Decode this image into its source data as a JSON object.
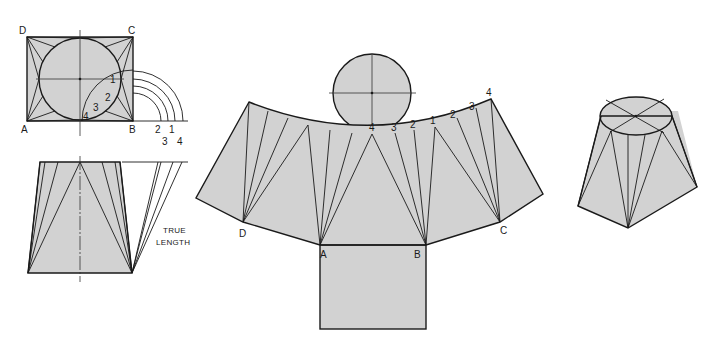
{
  "figure": {
    "colors": {
      "fill": "#d2d2d2",
      "line": "#1a1a1a",
      "background": "#ffffff"
    }
  },
  "top_view": {
    "corner_labels": {
      "D": "D",
      "C": "C",
      "A": "A",
      "B": "B"
    },
    "division_labels": [
      "1",
      "2",
      "3",
      "4"
    ]
  },
  "true_length_diagram": {
    "base_labels": [
      "2",
      "1",
      "3",
      "4"
    ],
    "caption_line1": "TRUE",
    "caption_line2": "LENGTH"
  },
  "pattern": {
    "corner_labels": {
      "D": "D",
      "A": "A",
      "B": "B",
      "C": "C"
    },
    "arc_labels": [
      "4",
      "3",
      "2",
      "1",
      "2",
      "3",
      "4"
    ]
  },
  "pictorial": {
    "label": "Pictorial view of transition piece"
  }
}
